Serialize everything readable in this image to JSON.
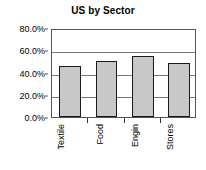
{
  "chart_data": {
    "type": "bar",
    "title": "US by Sector",
    "xlabel": "",
    "ylabel": "",
    "categories": [
      "Textile",
      "Food",
      "Engin",
      "Stores"
    ],
    "values": [
      46.0,
      50.0,
      55.0,
      48.5
    ],
    "ylim": [
      0,
      80
    ],
    "ytick_values": [
      0,
      20,
      40,
      60,
      80
    ],
    "ytick_labels": [
      "0.0%",
      "20.0%",
      "40.0%",
      "60.0%",
      "80.0%"
    ],
    "grid": true,
    "legend": false,
    "legend_position": "none",
    "bar_fill_color": "#c8c8c8",
    "bar_border_color": "#1a1a1a",
    "axis_color": "#555555",
    "gridline_color": "#777777",
    "background_color": "#ffffff",
    "xtick_label_rotation": 90
  }
}
